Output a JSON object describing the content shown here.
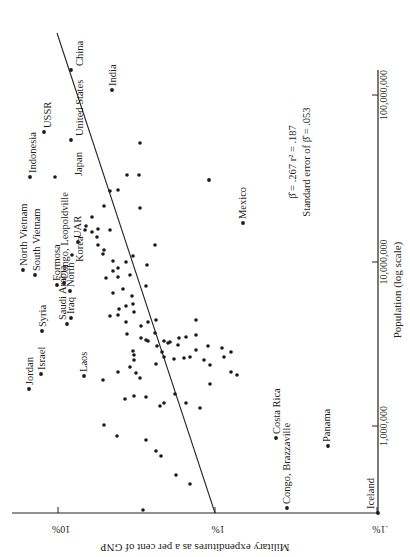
{
  "chart_data": {
    "type": "scatter",
    "orientation": "rotated 90 degrees clockwise (printed sideways)",
    "title": "",
    "xlabel": "Population (log scale)",
    "ylabel": "Military expenditures as a per cent of GNP",
    "x_scale": "log",
    "y_scale": "log",
    "x_ticks": [
      "1,000,000",
      "10,000,000",
      "100,000,000"
    ],
    "y_ticks": [
      "10%",
      "1%",
      ".1%"
    ],
    "xlim": [
      200000,
      1000000000
    ],
    "ylim": [
      0.1,
      20
    ],
    "grid": false,
    "annotation": {
      "line1": "β̂ = .267    r² = .187",
      "line2": "Standard error of β̂ = .053"
    },
    "regression_line": {
      "slope_beta": 0.267,
      "r_squared": 0.187,
      "std_error": 0.053
    },
    "labeled_points": [
      {
        "name": "China",
        "population": 690000000,
        "military_pct": 5.2
      },
      {
        "name": "India",
        "population": 440000000,
        "military_pct": 2.1
      },
      {
        "name": "USSR",
        "population": 220000000,
        "military_pct": 10.5
      },
      {
        "name": "United States",
        "population": 185000000,
        "military_pct": 6.1
      },
      {
        "name": "Indonesia",
        "population": 98000000,
        "military_pct": 14.0
      },
      {
        "name": "Japan",
        "population": 95000000,
        "military_pct": 1.2
      },
      {
        "name": "Mexico",
        "population": 36000000,
        "military_pct": 0.7
      },
      {
        "name": "North Vietnam",
        "population": 16000000,
        "military_pct": 18.0
      },
      {
        "name": "South Vietnam",
        "population": 14500000,
        "military_pct": 15.5
      },
      {
        "name": "Formosa",
        "population": 11500000,
        "military_pct": 10.5
      },
      {
        "name": "Congo, Leopoldville",
        "population": 14000000,
        "military_pct": 10.0
      },
      {
        "name": "UAR",
        "population": 27000000,
        "military_pct": 8.2
      },
      {
        "name": "North Korea",
        "population": 10000000,
        "military_pct": 8.8
      },
      {
        "name": "Iraq",
        "population": 7000000,
        "military_pct": 10.0
      },
      {
        "name": "Syria",
        "population": 4900000,
        "military_pct": 14.5
      },
      {
        "name": "Saudi Arabia",
        "population": 6000000,
        "military_pct": 9.5
      },
      {
        "name": "Jordan",
        "population": 1800000,
        "military_pct": 19.0
      },
      {
        "name": "Israel",
        "population": 2200000,
        "military_pct": 14.0
      },
      {
        "name": "Laos",
        "population": 2100000,
        "military_pct": 10.2
      },
      {
        "name": "Costa Rica",
        "population": 1300000,
        "military_pct": 0.34
      },
      {
        "name": "Congo, Brazzaville",
        "population": 950000,
        "military_pct": 0.29
      },
      {
        "name": "Panama",
        "population": 1050000,
        "military_pct": 0.16
      },
      {
        "name": "Iceland",
        "population": 180000,
        "military_pct": 0.1
      }
    ],
    "unlabeled_point_count": 95
  },
  "screen": {
    "y_axis_line": {
      "x1": 12,
      "y1": 513,
      "x2": 378,
      "y2": 513
    },
    "x_axis_line": {
      "x1": 378,
      "y1": 513,
      "x2": 378,
      "y2": 70
    },
    "regression_line": {
      "x1": 215,
      "y1": 513,
      "x2": 57,
      "y2": 33
    },
    "y_ticks": [
      {
        "label": "10%",
        "x": 58
      },
      {
        "label": "1%",
        "x": 215
      },
      {
        "label": ".1%",
        "x": 377
      }
    ],
    "x_ticks": [
      {
        "label": "1,000,000",
        "y": 426
      },
      {
        "label": "10,000,000",
        "y": 262
      },
      {
        "label": "100,000,000",
        "y": 95
      }
    ],
    "ylabel_pos": {
      "x": 195,
      "y": 552
    },
    "xlabel_pos": {
      "x": 403,
      "y": 290
    },
    "annotation_pos": {
      "x": 300,
      "y": 162
    },
    "labels": [
      {
        "text": "China",
        "x": 80,
        "y": 72,
        "dot": [
          71,
          70
        ]
      },
      {
        "text": "India",
        "x": 113,
        "y": 63,
        "dot": [
          112,
          90
        ]
      },
      {
        "text": "USSR",
        "x": 48,
        "y": 105,
        "dot": [
          44,
          132
        ]
      },
      {
        "text": "United States",
        "x": 80,
        "y": 115,
        "dot": [
          71,
          140
        ]
      },
      {
        "text": "Indonesia",
        "x": 33,
        "y": 150,
        "dot": [
          30,
          177
        ]
      },
      {
        "text": "Japan",
        "x": 79,
        "y": 178,
        "dot": [
          209,
          180
        ]
      },
      {
        "text": "Mexico",
        "x": 243,
        "y": 195,
        "dot": [
          243,
          223
        ]
      },
      {
        "text": "North Vietnam",
        "x": 24,
        "y": 205,
        "dot": [
          23,
          270
        ]
      },
      {
        "text": "South Vietnam",
        "x": 37,
        "y": 211,
        "dot": [
          35,
          275
        ]
      },
      {
        "text": "Formosa",
        "x": 57,
        "y": 250,
        "dot": [
          57,
          285
        ]
      },
      {
        "text": "Congo, Leopoldville",
        "x": 65,
        "y": 190,
        "dot": [
          64,
          283
        ]
      },
      {
        "text": "UAR",
        "x": 78,
        "y": 218,
        "dot": [
          78,
          242
        ]
      },
      {
        "text": "North",
        "x": 71,
        "y": 262,
        "dot": [
          70,
          291
        ]
      },
      {
        "text": "Korea",
        "x": 80,
        "y": 262,
        "dot": null
      },
      {
        "text": "Iraq",
        "x": 71,
        "y": 291,
        "dot": [
          71,
          318
        ]
      },
      {
        "text": "Syria",
        "x": 43,
        "y": 310,
        "dot": [
          42,
          331
        ]
      },
      {
        "text": "Saudi Arabia",
        "x": 63,
        "y": 320,
        "dot": [
          67,
          324
        ]
      },
      {
        "text": "Jordan",
        "x": 30,
        "y": 345,
        "dot": [
          29,
          389
        ]
      },
      {
        "text": "Israel",
        "x": 42,
        "y": 352,
        "dot": [
          41,
          374
        ]
      },
      {
        "text": "Laos",
        "x": 84,
        "y": 353,
        "dot": [
          84,
          376
        ]
      },
      {
        "text": "Costa Rica",
        "x": 277,
        "y": 411,
        "dot": [
          276,
          438
        ]
      },
      {
        "text": "Congo, Brazzaville",
        "x": 287,
        "y": 424,
        "dot": [
          287,
          508
        ]
      },
      {
        "text": "Panama",
        "x": 327,
        "y": 415,
        "dot": [
          328,
          446
        ]
      },
      {
        "text": "Iceland",
        "x": 371,
        "y": 492,
        "dot": [
          378,
          513
        ]
      }
    ],
    "dots": [
      [
        55,
        177
      ],
      [
        72,
        255
      ],
      [
        92,
        232
      ],
      [
        92,
        217
      ],
      [
        98,
        229
      ],
      [
        110,
        191
      ],
      [
        104,
        206
      ],
      [
        118,
        190
      ],
      [
        127,
        175
      ],
      [
        139,
        175
      ],
      [
        140,
        143
      ],
      [
        85,
        230
      ],
      [
        86,
        226
      ],
      [
        97,
        237
      ],
      [
        98,
        245
      ],
      [
        104,
        250
      ],
      [
        110,
        230
      ],
      [
        113,
        261
      ],
      [
        118,
        268
      ],
      [
        133,
        256
      ],
      [
        140,
        208
      ],
      [
        103,
        254
      ],
      [
        113,
        271
      ],
      [
        118,
        277
      ],
      [
        123,
        289
      ],
      [
        126,
        262
      ],
      [
        130,
        275
      ],
      [
        132,
        296
      ],
      [
        147,
        265
      ],
      [
        155,
        245
      ],
      [
        146,
        286
      ],
      [
        106,
        278
      ],
      [
        113,
        293
      ],
      [
        119,
        309
      ],
      [
        126,
        306
      ],
      [
        133,
        304
      ],
      [
        110,
        316
      ],
      [
        118,
        315
      ],
      [
        134,
        312
      ],
      [
        126,
        322
      ],
      [
        141,
        326
      ],
      [
        148,
        322
      ],
      [
        127,
        334
      ],
      [
        148,
        341
      ],
      [
        155,
        333
      ],
      [
        133,
        351
      ],
      [
        141,
        338
      ],
      [
        156,
        364
      ],
      [
        162,
        352
      ],
      [
        170,
        342
      ],
      [
        179,
        338
      ],
      [
        186,
        337
      ],
      [
        196,
        350
      ],
      [
        130,
        367
      ],
      [
        134,
        360
      ],
      [
        134,
        355
      ],
      [
        136,
        373
      ],
      [
        140,
        378
      ],
      [
        146,
        340
      ],
      [
        157,
        346
      ],
      [
        164,
        341
      ],
      [
        168,
        343
      ],
      [
        178,
        345
      ],
      [
        196,
        335
      ],
      [
        103,
        380
      ],
      [
        134,
        396
      ],
      [
        125,
        399
      ],
      [
        118,
        372
      ],
      [
        146,
        397
      ],
      [
        160,
        406
      ],
      [
        164,
        403
      ],
      [
        175,
        394
      ],
      [
        186,
        403
      ],
      [
        200,
        408
      ],
      [
        210,
        384
      ],
      [
        156,
        320
      ],
      [
        164,
        357
      ],
      [
        174,
        359
      ],
      [
        184,
        358
      ],
      [
        190,
        357
      ],
      [
        196,
        320
      ],
      [
        204,
        360
      ],
      [
        210,
        365
      ],
      [
        224,
        357
      ],
      [
        231,
        372
      ],
      [
        237,
        375
      ],
      [
        208,
        346
      ],
      [
        222,
        348
      ],
      [
        231,
        352
      ],
      [
        104,
        425
      ],
      [
        117,
        436
      ],
      [
        156,
        451
      ],
      [
        161,
        456
      ],
      [
        176,
        475
      ],
      [
        190,
        484
      ],
      [
        143,
        510
      ],
      [
        146,
        440
      ]
    ]
  }
}
